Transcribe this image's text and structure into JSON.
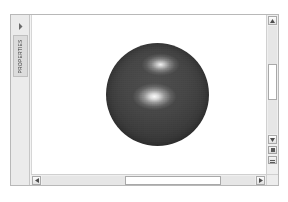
{
  "window": {
    "background_color": "#f3f3f3",
    "border_color": "#b8b8b8"
  },
  "sidebar": {
    "collapsed": true,
    "expand_icon": "chevron-right-icon",
    "tab_label": "PROPERTIES",
    "background_color": "#ebebeb"
  },
  "viewport": {
    "background_color": "#ffffff",
    "object": {
      "name": "sphere",
      "shape": "sphere",
      "base_color": "#3f3f3f",
      "highlight_color": "#ffffff",
      "highlights": [
        {
          "name": "upper-specular-highlight",
          "x_pct": 53,
          "y_pct": 21
        },
        {
          "name": "lower-specular-highlight",
          "x_pct": 47,
          "y_pct": 52
        }
      ]
    }
  },
  "vertical_scrollbar": {
    "up_icon": "arrow-up-icon",
    "down_icon": "arrow-down-icon",
    "thumb_position_pct": 35,
    "tools": [
      {
        "name": "zoom-tool-button",
        "icon": "square-icon"
      },
      {
        "name": "pan-tool-button",
        "icon": "lines-icon"
      }
    ]
  },
  "horizontal_scrollbar": {
    "left_icon": "arrow-left-icon",
    "right_icon": "arrow-right-icon",
    "thumb_position_pct": 40
  }
}
